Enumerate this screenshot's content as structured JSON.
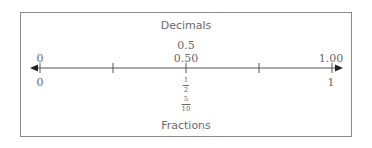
{
  "diagram": {
    "type": "number_line",
    "top_label": "Decimals",
    "bottom_label": "Fractions",
    "range": [
      0,
      1
    ],
    "ticks": [
      0,
      0.25,
      0.5,
      0.75,
      1
    ],
    "decimal_labels": {
      "zero": "0",
      "half_a": "0.5",
      "half_b": "0.50",
      "one": "1.00"
    },
    "fraction_labels": {
      "zero": "0",
      "one": "1",
      "half_1": {
        "numerator": "1",
        "denominator": "2"
      },
      "half_2": {
        "numerator": "5",
        "denominator": "10"
      }
    },
    "arrows": "both ends",
    "colors": {
      "line": "#555555",
      "text": "#6a6a6a",
      "border": "#8a8a8a"
    }
  }
}
